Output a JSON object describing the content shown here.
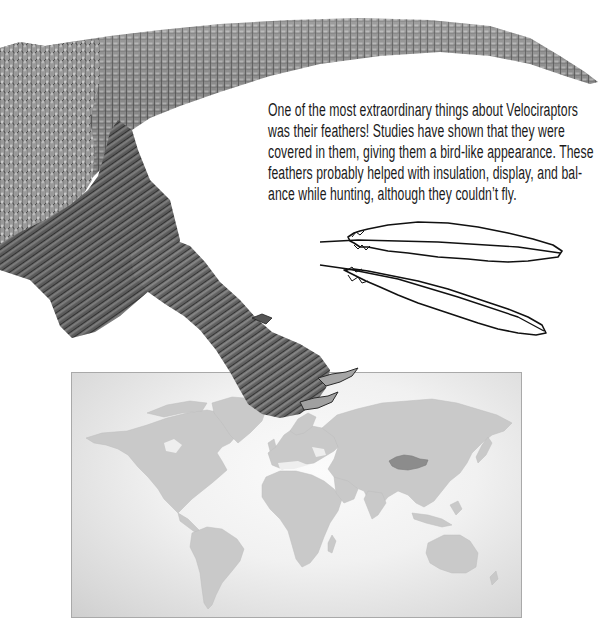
{
  "article": {
    "paragraph_lines": [
      "One of the most extraordinary things about Velociraptors",
      "was their feathers! Studies have shown that they were",
      "covered in them, giving them a bird-like appearance. These",
      "feathers probably helped with insulation, display, and bal-",
      "ance while hunting, although they couldn’t fly."
    ]
  },
  "illustrations": {
    "dinosaur": {
      "icon": "velociraptor-tail-and-leg-illustration",
      "style": "grayscale scaly texture"
    },
    "feathers": {
      "icon": "feather-outline-icon",
      "count": 2
    },
    "map": {
      "icon": "world-map",
      "highlighted_region": "Mongolia",
      "land_color": "#c8c8c8",
      "highlight_color": "#8a8a8a",
      "frame_color": "#a9a9a9"
    }
  }
}
